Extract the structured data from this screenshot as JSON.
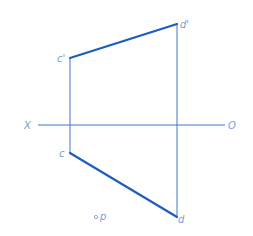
{
  "diagram": {
    "type": "orthographic-projection",
    "colors": {
      "thin_line": "#3f78d0",
      "thick_line": "#1e5cc0",
      "label": "#7e9cd6"
    },
    "axis": {
      "left_label": "X",
      "right_label": "O",
      "y": 125,
      "x1": 38,
      "x2": 225
    },
    "points": {
      "c_prime": {
        "label": "c'",
        "x": 70,
        "y": 58
      },
      "d_prime": {
        "label": "d'",
        "x": 177,
        "y": 24
      },
      "c": {
        "label": "c",
        "x": 70,
        "y": 153
      },
      "d": {
        "label": "d",
        "x": 177,
        "y": 217
      },
      "p": {
        "label": "p",
        "x": 96,
        "y": 217
      }
    },
    "lines": [
      {
        "name": "front-view-cd",
        "from": "c_prime",
        "to": "d_prime",
        "style": "thick"
      },
      {
        "name": "top-view-cd",
        "from": "c",
        "to": "d",
        "style": "thick"
      },
      {
        "name": "projector-c",
        "from": "c_prime",
        "to": "c",
        "style": "thin"
      },
      {
        "name": "projector-d",
        "from": "d_prime",
        "to": "d",
        "style": "thin"
      }
    ]
  }
}
